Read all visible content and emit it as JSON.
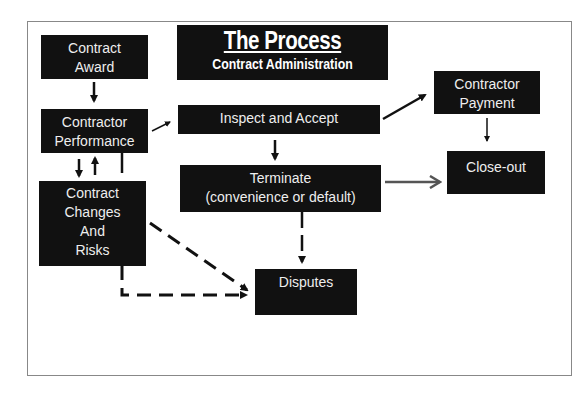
{
  "title": {
    "main": "The Process",
    "subtitle": "Contract Administration"
  },
  "nodes": {
    "contract_award": [
      "Contract",
      "Award"
    ],
    "contractor_performance": [
      "Contractor",
      "Performance"
    ],
    "contract_changes": [
      "Contract",
      "Changes",
      "And",
      "Risks"
    ],
    "inspect_accept": [
      "Inspect and Accept"
    ],
    "terminate": [
      "Terminate",
      "(convenience or default)"
    ],
    "disputes": [
      "Disputes"
    ],
    "contractor_payment": [
      "Contractor",
      "Payment"
    ],
    "close_out": [
      "Close-out"
    ]
  },
  "edges": [
    {
      "from": "Contract Award",
      "to": "Contractor Performance",
      "style": "solid"
    },
    {
      "from": "Contractor Performance",
      "to": "Contract Changes And Risks",
      "style": "solid"
    },
    {
      "from": "Contract Changes And Risks",
      "to": "Contractor Performance",
      "style": "solid"
    },
    {
      "from": "Contractor Performance",
      "to": "Inspect and Accept",
      "style": "solid"
    },
    {
      "from": "Inspect and Accept",
      "to": "Contractor Payment",
      "style": "solid"
    },
    {
      "from": "Inspect and Accept",
      "to": "Terminate",
      "style": "solid"
    },
    {
      "from": "Contractor Payment",
      "to": "Close-out",
      "style": "solid"
    },
    {
      "from": "Terminate",
      "to": "Close-out",
      "style": "solid-gray"
    },
    {
      "from": "Terminate",
      "to": "Disputes",
      "style": "solid"
    },
    {
      "from": "Contract Changes And Risks",
      "to": "Disputes",
      "style": "dashed"
    },
    {
      "from": "Contractor Performance",
      "to": "Disputes",
      "style": "dashed"
    }
  ],
  "colors": {
    "box": "#111111",
    "text": "#eeeeee",
    "arrow": "#111111",
    "gray_arrow": "#555555",
    "frame": "#888888"
  }
}
